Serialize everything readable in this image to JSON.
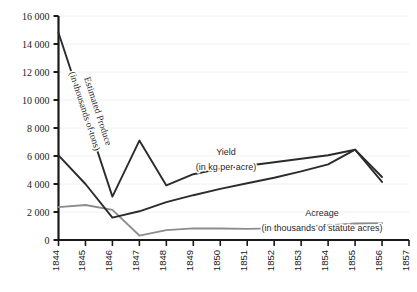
{
  "chart_data": {
    "type": "line",
    "title": "",
    "xlabel": "",
    "ylabel": "",
    "x": [
      1844,
      1845,
      1846,
      1847,
      1848,
      1849,
      1850,
      1851,
      1852,
      1853,
      1854,
      1855,
      1856,
      1857
    ],
    "xlim": [
      1844,
      1857
    ],
    "ylim": [
      0,
      16000
    ],
    "yticks": [
      0,
      2000,
      4000,
      6000,
      8000,
      10000,
      12000,
      14000,
      16000
    ],
    "ytick_labels": [
      "0",
      "2 000",
      "4 000",
      "6 000",
      "8 000",
      "10 000",
      "12 000",
      "14 000",
      "16 000"
    ],
    "xtick_labels": [
      "1844",
      "1845",
      "1846",
      "1847",
      "1848",
      "1849",
      "1850",
      "1851",
      "1852",
      "1853",
      "1854",
      "1855",
      "1856",
      "1857"
    ],
    "grid": true,
    "grid_color": "#f0f0f0",
    "legend": "inline-annotations",
    "series": [
      {
        "name": "Estimated Produce",
        "unit_label": "(in thousands of tons)",
        "color": "#2b2b2b",
        "label_rotated": true,
        "x": [
          1844,
          1846,
          1847,
          1848,
          1849,
          1850,
          1851,
          1852,
          1853,
          1854,
          1855,
          1856
        ],
        "values": [
          14800,
          3100,
          7100,
          3900,
          4700,
          5100,
          5300,
          5550,
          5800,
          6050,
          6450,
          4150
        ]
      },
      {
        "name": "Yield",
        "unit_label": "(in kg per acre)",
        "color": "#2b2b2b",
        "label_rotated": false,
        "x": [
          1844,
          1845,
          1846,
          1847,
          1848,
          1849,
          1850,
          1851,
          1852,
          1853,
          1854,
          1855,
          1856
        ],
        "values": [
          6050,
          4000,
          1600,
          2050,
          2700,
          3200,
          3650,
          4050,
          4450,
          4900,
          5400,
          6450,
          4500
        ]
      },
      {
        "name": "Acreage",
        "unit_label": "(in thousands of statute acres)",
        "color": "#8c8c8c",
        "label_rotated": false,
        "x": [
          1844,
          1845,
          1846,
          1847,
          1848,
          1849,
          1850,
          1851,
          1852,
          1853,
          1854,
          1855,
          1856
        ],
        "values": [
          2350,
          2500,
          2150,
          320,
          700,
          830,
          820,
          800,
          830,
          950,
          1050,
          1180,
          1200
        ]
      }
    ],
    "annotations": [
      {
        "id": "produce",
        "text": "Estimated Produce",
        "sub": "(in thousands of tons)"
      },
      {
        "id": "yield",
        "text": "Yield",
        "sub": "(in kg per acre)"
      },
      {
        "id": "acreage",
        "text": "Acreage",
        "sub": "(in thousands of statute acres)"
      }
    ]
  }
}
